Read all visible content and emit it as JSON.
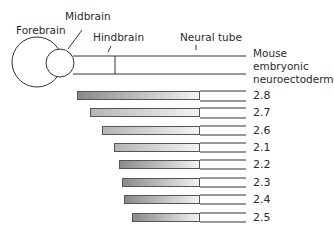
{
  "labels": {
    "forebrain": "Forebrain",
    "midbrain": "Midbrain",
    "hindbrain": "Hindbrain",
    "neural_tube": "Neural tube",
    "tissue_line1": "Mouse",
    "tissue_line2": "embryonic",
    "tissue_line3": "neuroectoderm"
  },
  "bars": [
    {
      "label": "2.8",
      "start": 77,
      "top": 90,
      "shade": "dark"
    },
    {
      "label": "2.7",
      "start": 90,
      "top": 107,
      "shade": "light"
    },
    {
      "label": "2.6",
      "start": 102,
      "top": 125,
      "shade": "light"
    },
    {
      "label": "2.1",
      "start": 114,
      "top": 142,
      "shade": "light"
    },
    {
      "label": "2.2",
      "start": 119,
      "top": 159,
      "shade": "dark"
    },
    {
      "label": "2.3",
      "start": 122,
      "top": 177,
      "shade": "dark"
    },
    {
      "label": "2.4",
      "start": 124,
      "top": 194,
      "shade": "dark"
    },
    {
      "label": "2.5",
      "start": 132,
      "top": 212,
      "shade": "dark"
    }
  ],
  "bar_end_x": 246
}
